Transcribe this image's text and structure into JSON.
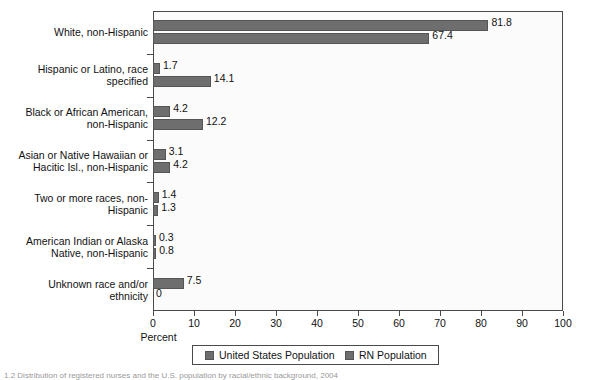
{
  "chart_data": {
    "type": "bar",
    "orientation": "horizontal",
    "title": "",
    "xlabel": "Percent",
    "ylabel": "",
    "xlim": [
      0,
      100
    ],
    "xticks": [
      0,
      10,
      20,
      30,
      40,
      50,
      60,
      70,
      80,
      90,
      100
    ],
    "grid": false,
    "legend_position": "bottom",
    "categories": [
      "White, non-Hispanic",
      "Hispanic or Latino, race specified",
      "Black or African American, non-Hispanic",
      "Asian or Native Hawaiian or Hacitic Isl., non-Hispanic",
      "Two or more races, non-Hispanic",
      "American Indian or Alaska Native, non-Hispanic",
      "Unknown race and/or ethnicity"
    ],
    "category_lines": [
      [
        "White, non-Hispanic"
      ],
      [
        "Hispanic or Latino, race",
        "specified"
      ],
      [
        "Black or African American,",
        "non-Hispanic"
      ],
      [
        "Asian or Native Hawaiian or",
        "Hacitic Isl., non-Hispanic"
      ],
      [
        "Two or more races, non-",
        "Hispanic"
      ],
      [
        "American Indian or Alaska",
        "Native, non-Hispanic"
      ],
      [
        "Unknown race and/or",
        "ethnicity"
      ]
    ],
    "series": [
      {
        "name": "United States Population",
        "color": "#6e6e6e",
        "values": [
          81.8,
          1.7,
          4.2,
          3.1,
          1.4,
          0.3,
          7.5
        ],
        "labels": [
          "81.8",
          "1.7",
          "4.2",
          "3.1",
          "1.4",
          "0.3",
          "7.5"
        ]
      },
      {
        "name": "RN Population",
        "color": "#6e6e6e",
        "values": [
          67.4,
          14.1,
          12.2,
          4.2,
          1.3,
          0.8,
          0
        ],
        "labels": [
          "67.4",
          "14.1",
          "12.2",
          "4.2",
          "1.3",
          "0.8",
          "0"
        ]
      }
    ]
  },
  "legend": {
    "entries": [
      {
        "label": "United States Population"
      },
      {
        "label": "RN Population"
      }
    ]
  },
  "axis": {
    "x_title": "Percent",
    "tick_labels": [
      "0",
      "10",
      "20",
      "30",
      "40",
      "50",
      "60",
      "70",
      "80",
      "90",
      "100"
    ]
  },
  "caption": {
    "text": "1.2 Distribution of registered nurses and the U.S. population by racial/ethnic background, 2004"
  },
  "colors": {
    "bar": "#6e6e6e",
    "axis": "#4a4a4a",
    "plot_background": "#fbfbfb",
    "page_background": "#ffffff",
    "text": "#111111"
  }
}
